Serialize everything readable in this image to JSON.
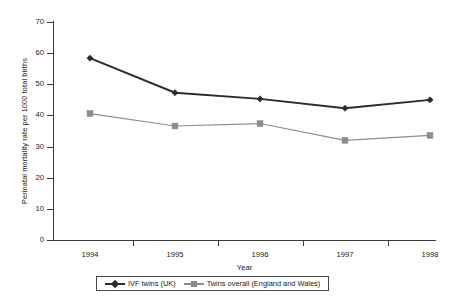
{
  "chart_data": {
    "type": "line",
    "title": "",
    "xlabel": "Year",
    "ylabel": "Perinatal mortality rate per 1000 total births",
    "categories": [
      "1994",
      "1995",
      "1996",
      "1997",
      "1998"
    ],
    "x": [
      1994,
      1995,
      1996,
      1997,
      1998
    ],
    "ylim": [
      0,
      70
    ],
    "y_ticks": [
      0,
      10,
      20,
      30,
      40,
      50,
      60,
      70
    ],
    "y_tick_labels": [
      "0",
      "10",
      "20",
      "30",
      "40",
      "50",
      "60",
      "70"
    ],
    "grid": false,
    "legend_position": "bottom-center",
    "series": [
      {
        "name": "IVF twins (UK)",
        "values": [
          58.4,
          47.3,
          45.3,
          42.3,
          45.0
        ],
        "color": "#2b2b2b",
        "marker": "diamond",
        "line_width": 1.9
      },
      {
        "name": "Twins overall (England and Wales)",
        "values": [
          40.6,
          36.6,
          37.4,
          32.0,
          33.6
        ],
        "color": "#8c8c8c",
        "marker": "square",
        "line_width": 1.2
      }
    ]
  },
  "legend": {
    "entries": [
      {
        "label": "IVF twins (UK)"
      },
      {
        "label": "Twins overall (England and Wales)"
      }
    ]
  },
  "colors": {
    "axis": "#3a3a3a",
    "series_1": "#2b2b2b",
    "series_2": "#8c8c8c",
    "background": "#ffffff"
  }
}
